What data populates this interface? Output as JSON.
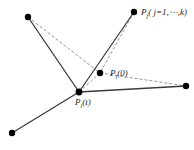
{
  "diagram": {
    "labels": {
      "pj": "P",
      "pj_sub": "j",
      "pj_range": "( j=1,⋯,k)",
      "pi0": "P",
      "pi0_sub": "i",
      "pi0_arg": "(0)",
      "pit": "P",
      "pit_sub": "i",
      "pit_arg": "(t)"
    },
    "points": [
      {
        "id": "upper-left",
        "x": 28,
        "y": 17
      },
      {
        "id": "pj-top",
        "x": 134,
        "y": 12
      },
      {
        "id": "pi0",
        "x": 100,
        "y": 73
      },
      {
        "id": "pit",
        "x": 79,
        "y": 92
      },
      {
        "id": "right",
        "x": 186,
        "y": 86
      },
      {
        "id": "bottom-left",
        "x": 12,
        "y": 133
      }
    ],
    "colors": {
      "solid_edge": "#3a3a3a",
      "dashed_edge": "#8a8a8a",
      "node": "#000000"
    }
  }
}
